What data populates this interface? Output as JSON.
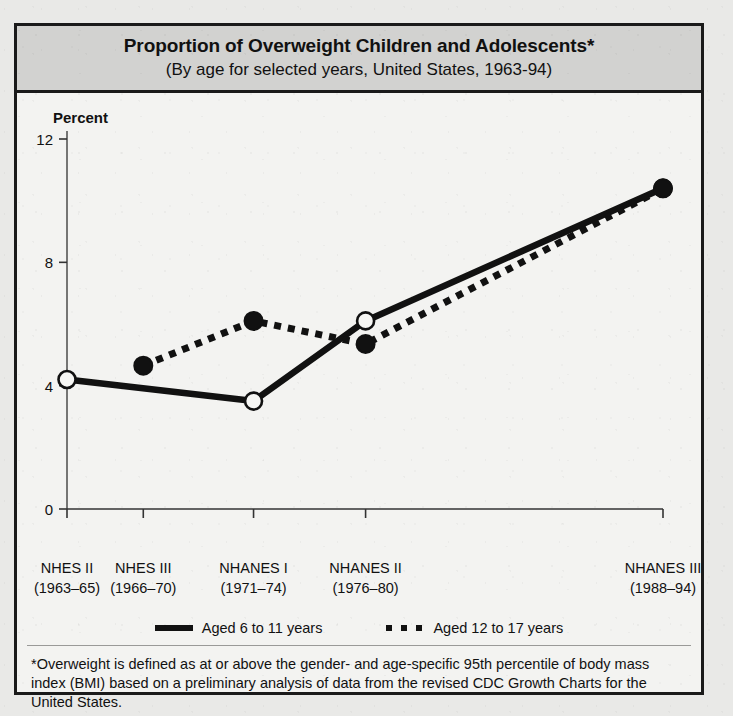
{
  "figure": {
    "title_main": "Proportion of Overweight Children and Adolescents*",
    "title_sub": "(By age for selected years, United States, 1963-94)",
    "footnote": "*Overweight is defined as at or above the gender- and age-specific 95th percentile of body mass index (BMI) based on a preliminary analysis of data from the revised CDC Growth Charts for the United States.",
    "colors": {
      "ink": "#111111",
      "title_band": "#d2d2d0",
      "paper": "#f3f3f1",
      "frame": "#1a1a1a"
    }
  },
  "chart_data": {
    "type": "line",
    "title": "Proportion of Overweight Children and Adolescents*",
    "subtitle": "(By age for selected years, United States, 1963-94)",
    "xlabel": "",
    "ylabel": "Percent",
    "ylim": [
      0,
      12
    ],
    "yticks": [
      0,
      4,
      8,
      12
    ],
    "ytick_labels": [
      "0",
      "4",
      "8",
      "12"
    ],
    "grid": false,
    "legend_position": "bottom",
    "categories": [
      "NHES II",
      "NHES III",
      "NHANES I",
      "NHANES II",
      "NHANES III"
    ],
    "category_periods": [
      "(1963–65)",
      "(1966–70)",
      "(1971–74)",
      "(1976–80)",
      "(1988–94)"
    ],
    "x_positions_pct": [
      0,
      12.8,
      31.3,
      50.1,
      100.0
    ],
    "series": [
      {
        "name": "Aged 6 to 11 years",
        "style": "solid",
        "marker": "open-circle",
        "values": [
          4.2,
          null,
          3.5,
          6.1,
          10.4
        ]
      },
      {
        "name": "Aged 12 to 17 years",
        "style": "dotted",
        "marker": "filled-circle",
        "values": [
          null,
          4.65,
          6.1,
          5.35,
          10.4
        ]
      }
    ],
    "annotations": [
      "*Overweight is defined as at or above the gender- and age-specific 95th percentile of body mass index (BMI) based on a preliminary analysis of data from the revised CDC Growth Charts for the United States."
    ]
  }
}
